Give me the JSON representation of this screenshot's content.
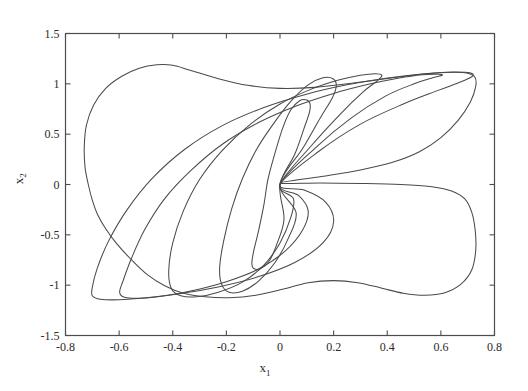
{
  "chart_data": {
    "type": "line",
    "title": "",
    "subtitle": "",
    "xlabel": "x_1",
    "ylabel": "x_2",
    "xlim": [
      -0.8,
      0.8
    ],
    "ylim": [
      -1.5,
      1.5
    ],
    "xticks": [
      -0.8,
      -0.6,
      -0.4,
      -0.2,
      0,
      0.2,
      0.4,
      0.6,
      0.8
    ],
    "xticklabels": [
      "-0.8",
      "-0.6",
      "-0.4",
      "-0.2",
      "0",
      "0.2",
      "0.4",
      "0.6",
      "0.8"
    ],
    "yticks": [
      -1.5,
      -1,
      -0.5,
      0,
      0.5,
      1,
      1.5
    ],
    "yticklabels": [
      "-1.5",
      "-1",
      "-0.5",
      "0",
      "0.5",
      "1",
      "1.5"
    ],
    "grid": false,
    "legend": null,
    "annotations": [],
    "series_color": "#4a4a4a",
    "series": [
      {
        "name": "orbit-1-innermost",
        "closed": true,
        "points": [
          [
            0.0,
            0.0
          ],
          [
            0.055,
            0.3
          ],
          [
            0.09,
            0.56
          ],
          [
            0.11,
            0.72
          ],
          [
            0.112,
            0.8
          ],
          [
            0.1,
            0.84
          ],
          [
            0.072,
            0.83
          ],
          [
            0.04,
            0.74
          ],
          [
            0.01,
            0.56
          ],
          [
            -0.02,
            0.3
          ],
          [
            -0.045,
            0.05
          ],
          [
            -0.06,
            -0.2
          ],
          [
            -0.08,
            -0.46
          ],
          [
            -0.098,
            -0.66
          ],
          [
            -0.105,
            -0.78
          ],
          [
            -0.098,
            -0.835
          ],
          [
            -0.072,
            -0.835
          ],
          [
            -0.04,
            -0.76
          ],
          [
            -0.01,
            -0.58
          ],
          [
            0.015,
            -0.34
          ],
          [
            0.0,
            0.0
          ]
        ]
      },
      {
        "name": "orbit-2",
        "closed": true,
        "points": [
          [
            0.0,
            0.0
          ],
          [
            0.085,
            0.36
          ],
          [
            0.15,
            0.66
          ],
          [
            0.195,
            0.86
          ],
          [
            0.21,
            0.98
          ],
          [
            0.198,
            1.05
          ],
          [
            0.16,
            1.06
          ],
          [
            0.105,
            0.99
          ],
          [
            0.045,
            0.84
          ],
          [
            -0.02,
            0.62
          ],
          [
            -0.085,
            0.36
          ],
          [
            -0.14,
            0.06
          ],
          [
            -0.18,
            -0.24
          ],
          [
            -0.21,
            -0.56
          ],
          [
            -0.225,
            -0.82
          ],
          [
            -0.218,
            -0.99
          ],
          [
            -0.19,
            -1.07
          ],
          [
            -0.14,
            -1.06
          ],
          [
            -0.08,
            -0.96
          ],
          [
            -0.02,
            -0.78
          ],
          [
            0.03,
            -0.54
          ],
          [
            0.06,
            -0.28
          ],
          [
            0.0,
            0.0
          ]
        ]
      },
      {
        "name": "orbit-3",
        "closed": true,
        "points": [
          [
            0.0,
            0.0
          ],
          [
            0.115,
            0.38
          ],
          [
            0.225,
            0.7
          ],
          [
            0.31,
            0.92
          ],
          [
            0.365,
            1.035
          ],
          [
            0.38,
            1.085
          ],
          [
            0.355,
            1.1
          ],
          [
            0.3,
            1.085
          ],
          [
            0.215,
            1.035
          ],
          [
            0.11,
            0.94
          ],
          [
            0.0,
            0.8
          ],
          [
            -0.11,
            0.6
          ],
          [
            -0.215,
            0.34
          ],
          [
            -0.3,
            0.05
          ],
          [
            -0.36,
            -0.26
          ],
          [
            -0.4,
            -0.58
          ],
          [
            -0.415,
            -0.86
          ],
          [
            -0.405,
            -1.035
          ],
          [
            -0.37,
            -1.105
          ],
          [
            -0.31,
            -1.115
          ],
          [
            -0.23,
            -1.07
          ],
          [
            -0.14,
            -0.97
          ],
          [
            -0.06,
            -0.8
          ],
          [
            0.0,
            -0.58
          ],
          [
            0.04,
            -0.33
          ],
          [
            0.05,
            -0.14
          ],
          [
            0.0,
            0.0
          ]
        ]
      },
      {
        "name": "orbit-4",
        "closed": true,
        "points": [
          [
            0.0,
            0.0
          ],
          [
            0.13,
            0.36
          ],
          [
            0.265,
            0.66
          ],
          [
            0.395,
            0.88
          ],
          [
            0.5,
            1.0
          ],
          [
            0.57,
            1.06
          ],
          [
            0.605,
            1.085
          ],
          [
            0.59,
            1.095
          ],
          [
            0.53,
            1.09
          ],
          [
            0.44,
            1.055
          ],
          [
            0.33,
            0.995
          ],
          [
            0.2,
            0.905
          ],
          [
            0.06,
            0.78
          ],
          [
            -0.08,
            0.615
          ],
          [
            -0.215,
            0.4
          ],
          [
            -0.33,
            0.145
          ],
          [
            -0.43,
            -0.14
          ],
          [
            -0.505,
            -0.45
          ],
          [
            -0.555,
            -0.74
          ],
          [
            -0.585,
            -0.955
          ],
          [
            -0.598,
            -1.07
          ],
          [
            -0.58,
            -1.12
          ],
          [
            -0.52,
            -1.13
          ],
          [
            -0.43,
            -1.105
          ],
          [
            -0.32,
            -1.05
          ],
          [
            -0.2,
            -0.965
          ],
          [
            -0.08,
            -0.84
          ],
          [
            0.02,
            -0.66
          ],
          [
            0.085,
            -0.45
          ],
          [
            0.105,
            -0.26
          ],
          [
            0.07,
            -0.11
          ],
          [
            0.0,
            0.0
          ]
        ]
      },
      {
        "name": "orbit-5",
        "closed": true,
        "points": [
          [
            0.0,
            0.0
          ],
          [
            0.145,
            0.33
          ],
          [
            0.3,
            0.6
          ],
          [
            0.46,
            0.8
          ],
          [
            0.59,
            0.935
          ],
          [
            0.675,
            1.02
          ],
          [
            0.715,
            1.07
          ],
          [
            0.718,
            1.1
          ],
          [
            0.69,
            1.115
          ],
          [
            0.62,
            1.115
          ],
          [
            0.52,
            1.095
          ],
          [
            0.395,
            1.055
          ],
          [
            0.25,
            0.99
          ],
          [
            0.095,
            0.895
          ],
          [
            -0.06,
            0.765
          ],
          [
            -0.215,
            0.585
          ],
          [
            -0.355,
            0.35
          ],
          [
            -0.475,
            0.065
          ],
          [
            -0.57,
            -0.25
          ],
          [
            -0.64,
            -0.565
          ],
          [
            -0.682,
            -0.835
          ],
          [
            -0.7,
            -1.02
          ],
          [
            -0.7,
            -1.105
          ],
          [
            -0.67,
            -1.14
          ],
          [
            -0.6,
            -1.145
          ],
          [
            -0.5,
            -1.125
          ],
          [
            -0.375,
            -1.085
          ],
          [
            -0.235,
            -1.02
          ],
          [
            -0.085,
            -0.92
          ],
          [
            0.055,
            -0.775
          ],
          [
            0.16,
            -0.58
          ],
          [
            0.2,
            -0.37
          ],
          [
            0.17,
            -0.175
          ],
          [
            0.09,
            -0.055
          ],
          [
            0.0,
            0.0
          ]
        ]
      },
      {
        "name": "orbit-6-outermost",
        "closed": true,
        "points": [
          [
            0.0,
            0.015
          ],
          [
            0.155,
            0.08
          ],
          [
            0.3,
            0.145
          ],
          [
            0.42,
            0.22
          ],
          [
            0.52,
            0.325
          ],
          [
            0.6,
            0.465
          ],
          [
            0.665,
            0.64
          ],
          [
            0.71,
            0.82
          ],
          [
            0.73,
            0.975
          ],
          [
            0.727,
            1.065
          ],
          [
            0.7,
            1.105
          ],
          [
            0.64,
            1.115
          ],
          [
            0.545,
            1.1
          ],
          [
            0.42,
            1.06
          ],
          [
            0.28,
            1.01
          ],
          [
            0.13,
            0.965
          ],
          [
            0.0,
            0.955
          ],
          [
            -0.12,
            0.985
          ],
          [
            -0.235,
            1.055
          ],
          [
            -0.335,
            1.135
          ],
          [
            -0.4,
            1.185
          ],
          [
            -0.46,
            1.19
          ],
          [
            -0.525,
            1.155
          ],
          [
            -0.59,
            1.075
          ],
          [
            -0.65,
            0.955
          ],
          [
            -0.695,
            0.79
          ],
          [
            -0.722,
            0.59
          ],
          [
            -0.73,
            0.375
          ],
          [
            -0.727,
            0.17
          ],
          [
            -0.715,
            0.0
          ],
          [
            -0.7,
            -0.155
          ],
          [
            -0.68,
            -0.3
          ],
          [
            -0.65,
            -0.44
          ],
          [
            -0.61,
            -0.585
          ],
          [
            -0.555,
            -0.745
          ],
          [
            -0.495,
            -0.895
          ],
          [
            -0.43,
            -1.005
          ],
          [
            -0.36,
            -1.08
          ],
          [
            -0.28,
            -1.115
          ],
          [
            -0.19,
            -1.125
          ],
          [
            -0.09,
            -1.1
          ],
          [
            0.01,
            -1.04
          ],
          [
            0.105,
            -0.975
          ],
          [
            0.2,
            -0.955
          ],
          [
            0.29,
            -0.975
          ],
          [
            0.38,
            -1.03
          ],
          [
            0.46,
            -1.08
          ],
          [
            0.54,
            -1.1
          ],
          [
            0.615,
            -1.075
          ],
          [
            0.675,
            -0.99
          ],
          [
            0.715,
            -0.85
          ],
          [
            0.73,
            -0.655
          ],
          [
            0.728,
            -0.455
          ],
          [
            0.715,
            -0.275
          ],
          [
            0.69,
            -0.145
          ],
          [
            0.64,
            -0.065
          ],
          [
            0.56,
            -0.02
          ],
          [
            0.45,
            0.0
          ],
          [
            0.3,
            0.01
          ],
          [
            0.15,
            0.015
          ],
          [
            0.0,
            0.015
          ]
        ]
      }
    ]
  },
  "figure": {
    "background_color": "#ffffff",
    "axes_color": "#4d4d4d",
    "line_color": "#4a4a4a"
  }
}
